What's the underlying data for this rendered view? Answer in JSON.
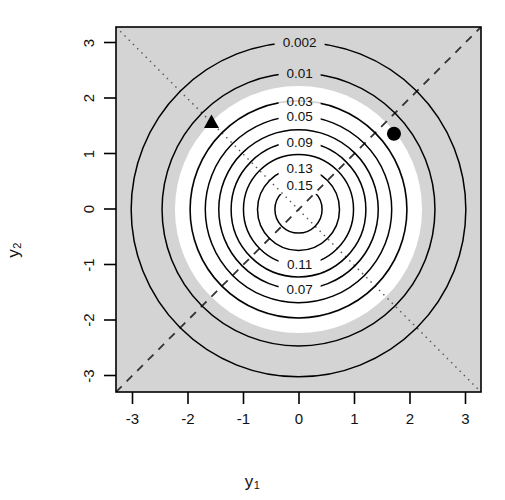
{
  "figure": {
    "type": "contour-plot",
    "background_color": "#ffffff",
    "panel_fill_color": "#d4d4d4",
    "panel_border_color": "#000000",
    "contour_color": "#000000",
    "marker_color": "#000000",
    "band_color": "#ffffff"
  },
  "axes": {
    "x": {
      "label": "y",
      "label_subscript": "1",
      "ticks": [
        "-3",
        "-2",
        "-1",
        "0",
        "1",
        "2",
        "3"
      ],
      "tick_values": [
        -3,
        -2,
        -1,
        0,
        1,
        2,
        3
      ],
      "range": [
        -3.25,
        3.25
      ]
    },
    "y": {
      "label": "y",
      "label_subscript": "2",
      "ticks": [
        "-3",
        "-2",
        "-1",
        "0",
        "1",
        "2",
        "3"
      ],
      "tick_values": [
        -3,
        -2,
        -1,
        0,
        1,
        2,
        3
      ],
      "range": [
        -3.25,
        3.25
      ]
    }
  },
  "chart_data": {
    "type": "contour",
    "title": "",
    "xlabel": "y1",
    "ylabel": "y2",
    "xlim": [
      -3.25,
      3.25
    ],
    "ylim": [
      -3.25,
      3.25
    ],
    "grid": false,
    "legend": "none",
    "contour_levels": [
      0.002,
      0.01,
      0.03,
      0.05,
      0.07,
      0.09,
      0.11,
      0.13,
      0.15
    ],
    "contour_labels": [
      "0.002",
      "0.01",
      "0.03",
      "0.05",
      "0.07",
      "0.09",
      "0.11",
      "0.13",
      "0.15"
    ],
    "contour_radii": [
      2.98,
      2.43,
      1.93,
      1.66,
      1.42,
      1.2,
      0.98,
      0.73,
      0.42
    ],
    "label_positions": [
      {
        "level": "0.002",
        "x": 0.02,
        "y": 2.98
      },
      {
        "level": "0.01",
        "x": 0.02,
        "y": 2.43
      },
      {
        "level": "0.03",
        "x": 0.02,
        "y": 1.93
      },
      {
        "level": "0.05",
        "x": 0.02,
        "y": 1.66
      },
      {
        "level": "0.09",
        "x": 0.02,
        "y": 1.2
      },
      {
        "level": "0.13",
        "x": 0.02,
        "y": 0.73
      },
      {
        "level": "0.15",
        "x": 0.02,
        "y": 0.42
      },
      {
        "level": "0.11",
        "x": 0.02,
        "y": -0.98
      },
      {
        "level": "0.07",
        "x": 0.02,
        "y": -1.42
      }
    ],
    "shading": {
      "outer_grey_from_radius": 2.2,
      "white_band_inner_radius": 1.95,
      "white_band_outer_radius": 2.2,
      "inner_grey_note": "panel grey shows again inside the white annulus toward the centre"
    },
    "reference_lines": [
      {
        "name": "identity-line",
        "style": "dashed",
        "equation": "y2 = y1",
        "from": [
          -3.25,
          -3.25
        ],
        "to": [
          3.25,
          3.25
        ]
      },
      {
        "name": "anti-identity-line",
        "style": "dotted",
        "equation": "y2 = -y1",
        "from": [
          -3.25,
          3.25
        ],
        "to": [
          3.25,
          -3.25
        ]
      }
    ],
    "points": [
      {
        "name": "triangle-point",
        "marker": "filled-triangle",
        "x": -1.55,
        "y": 1.55
      },
      {
        "name": "circle-point",
        "marker": "filled-circle",
        "x": 1.7,
        "y": 1.35
      }
    ]
  }
}
